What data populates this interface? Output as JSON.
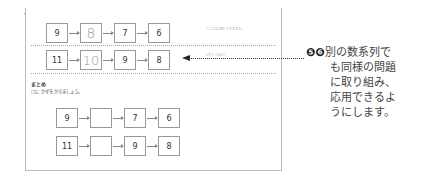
{
  "worksheet": {
    "rows": [
      {
        "hint": "ここには 何が 入りますか。",
        "cells": [
          "9",
          "8",
          "7",
          "6"
        ],
        "handwritten_index": 1
      },
      {
        "hint": "1ずつ へると？",
        "cells": [
          "11",
          "10",
          "9",
          "8"
        ],
        "handwritten_index": 1
      }
    ],
    "summary": {
      "title": "まとめ",
      "instruction": "□に かずを かきましょう。",
      "rows": [
        {
          "cells": [
            "9",
            "",
            "7",
            "6"
          ]
        },
        {
          "cells": [
            "11",
            "",
            "9",
            "8"
          ]
        }
      ]
    }
  },
  "annotation": {
    "markers": "❺❻",
    "lines": [
      "別の数系列で",
      "も同様の問題",
      "に取り組み、",
      "応用できるよ",
      "うにします。"
    ]
  }
}
